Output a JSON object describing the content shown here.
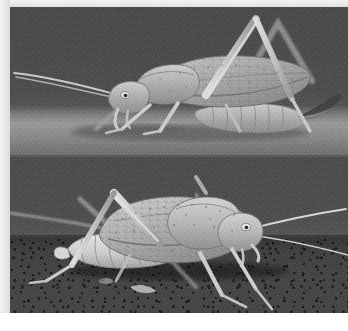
{
  "plate": {
    "title": "Katydid (bush cricket) two-view photographic plate",
    "orientation": "portrait",
    "background_color": "#ffffff",
    "margin_color": "#e9e9e9",
    "divider_color": "#5a5a5a",
    "panel_count": 2,
    "rendering": "grayscale photograph"
  },
  "panels": [
    {
      "id": "panel-top",
      "position": "top",
      "caption": "",
      "subject": "katydid, lateral view, facing left",
      "background_description": "flat mid-grey studio backdrop with pale horizontal surface band across lower third",
      "background_color": "#4d4d4d",
      "surface_color": "#97999a",
      "body_color": "#b9bbb6",
      "shadow_color": "#2f2f2f",
      "features": [
        "long hind femur raised in inverted-V above body",
        "speckled tegmen (forewing) with reticulate venation",
        "upturned dark ovipositor extending beyond abdomen",
        "long filamentous antennae sweeping left",
        "segmented abdomen resting on pale surface"
      ]
    },
    {
      "id": "panel-bottom",
      "position": "bottom",
      "caption": "",
      "subject": "katydid, lateral view, facing right",
      "background_description": "dark grey backdrop above coarse granular substrate",
      "background_color": "#4a4a4a",
      "surface_color": "#3f3f3f",
      "body_color": "#c2c4bf",
      "shadow_color": "#1d1d1d",
      "features": [
        "pale banded segmented abdomen",
        "mottled pronotum and tegmen with dense speckling",
        "head with pale round eye at right",
        "two very long antennae trailing to the right",
        "long slender legs planted on grit substrate"
      ]
    }
  ]
}
